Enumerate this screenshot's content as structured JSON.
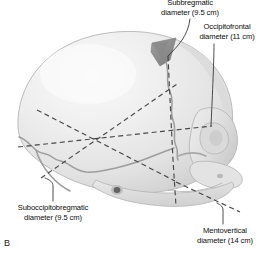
{
  "figure": {
    "panel_letter": "B",
    "background_color": "#ffffff",
    "ink_color": "#0c0c0c"
  },
  "illustration": {
    "name": "fetal-skull-diameters",
    "cranium_fill": "#ececec",
    "cranium_shade_light": "#f7f7f7",
    "cranium_shade_mid": "#dcdcdc",
    "cranium_shade_dark": "#c2c2c2",
    "fontanelle_fill": "#8f8f8f",
    "suture_color": "#9a9a9a",
    "outline_color": "#b4b4b4",
    "dashed_line_color": "#4a4a4a",
    "leader_line_color": "#333333",
    "parts": [
      "cranial-vault",
      "anterior-fontanelle",
      "coronal-suture",
      "lambdoid-suture",
      "squamous-suture",
      "external-acoustic-meatus",
      "orbit",
      "maxilla",
      "mandible",
      "zygomatic-arch"
    ]
  },
  "measurements": [
    {
      "id": "subbregmatic",
      "label_line1": "Subbregmatic",
      "label_line2": "diameter (9.5 cm)",
      "value": "9.5 cm"
    },
    {
      "id": "occipitofrontal",
      "label_line1": "Occipitofrontal",
      "label_line2": "diameter (11 cm)",
      "value": "11 cm"
    },
    {
      "id": "suboccipitobregmatic",
      "label_line1": "Suboccipitobregmatic",
      "label_line2": "diameter (9.5 cm)",
      "value": "9.5 cm"
    },
    {
      "id": "mentovertical",
      "label_line1": "Mentovertical",
      "label_line2": "diameter (14 cm)",
      "value": "14 cm"
    }
  ]
}
